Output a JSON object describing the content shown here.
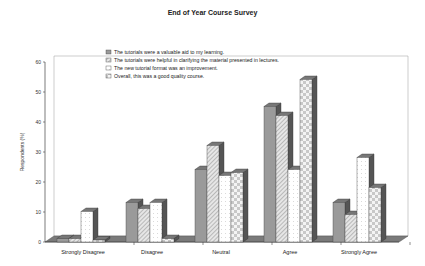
{
  "chart_data": {
    "type": "bar",
    "title": "End of Year Course Survey",
    "xlabel": "",
    "ylabel": "Respondents (%)",
    "ylim": [
      0,
      60
    ],
    "yticks": [
      0,
      10,
      20,
      30,
      40,
      50,
      60
    ],
    "grid": false,
    "legend_position": "upper-left inside plot",
    "style": "3D clustered column, grayscale patterns",
    "categories": [
      "Strongly Disagree",
      "Disagree",
      "Neutral",
      "Agree",
      "Strongly Agree"
    ],
    "series": [
      {
        "name": "The tutorials were a valuable aid to my learning.",
        "pattern": "solid-gray",
        "values": [
          1,
          13,
          24,
          45,
          13
        ]
      },
      {
        "name": "The tutorials were helpful in clarifying the material presented in lectures.",
        "pattern": "diagonal-hatch",
        "values": [
          1,
          11,
          32,
          42,
          9
        ]
      },
      {
        "name": "The new tutorial format was an improvement.",
        "pattern": "dotted-white",
        "values": [
          10,
          13,
          22,
          24,
          28
        ]
      },
      {
        "name": "Overall, this was a good quality course.",
        "pattern": "checkerboard",
        "values": [
          0,
          1,
          23,
          54,
          18
        ]
      }
    ]
  },
  "colors": {
    "solid": "#9a9a9a",
    "hatch_bg": "#e6e6e6",
    "hatch_line": "#8a8a8a",
    "dot_bg": "#ffffff",
    "check_a": "#c8c8c8",
    "check_b": "#f4f4f4",
    "floor": "#7a7a7a"
  }
}
